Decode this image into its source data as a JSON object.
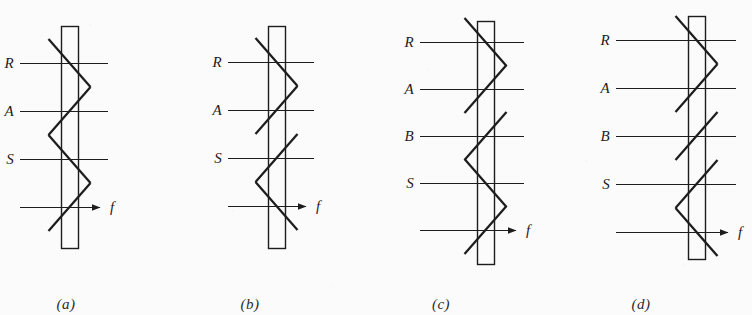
{
  "figure": {
    "type": "diagram",
    "background_color": "#fbfbfb",
    "line_color": "#1d1d1d",
    "panels": [
      {
        "caption": "(a)",
        "caption_x": 66,
        "caption_y": 296,
        "bar": {
          "x": 61,
          "y": 26,
          "width": 17,
          "height": 222
        },
        "levels": [
          {
            "label": "R",
            "y": 63,
            "line_x1": 20,
            "line_x2": 108,
            "slash": "backslash"
          },
          {
            "label": "A",
            "y": 111,
            "line_x1": 20,
            "line_x2": 108,
            "slash": "slash"
          },
          {
            "label": "S",
            "y": 159,
            "line_x1": 20,
            "line_x2": 108,
            "slash": "backslash"
          },
          {
            "label": "f",
            "y": 207,
            "line_x1": 20,
            "line_x2": 100,
            "slash": "slash",
            "arrow": true
          }
        ]
      },
      {
        "caption": "(b)",
        "caption_x": 250,
        "caption_y": 296,
        "bar": {
          "x": 268,
          "y": 26,
          "width": 17,
          "height": 222
        },
        "levels": [
          {
            "label": "R",
            "y": 62,
            "line_x1": 228,
            "line_x2": 314,
            "slash": "backslash"
          },
          {
            "label": "A",
            "y": 110,
            "line_x1": 228,
            "line_x2": 314,
            "slash": "slash"
          },
          {
            "label": "S",
            "y": 158,
            "line_x1": 228,
            "line_x2": 314,
            "slash": "slash"
          },
          {
            "label": "f",
            "y": 206,
            "line_x1": 228,
            "line_x2": 306,
            "slash": "backslash",
            "arrow": true
          }
        ]
      },
      {
        "caption": "(c)",
        "caption_x": 441,
        "caption_y": 296,
        "bar": {
          "x": 477,
          "y": 21,
          "width": 17,
          "height": 243
        },
        "levels": [
          {
            "label": "R",
            "y": 42,
            "line_x1": 420,
            "line_x2": 524,
            "slash": "backslash"
          },
          {
            "label": "A",
            "y": 89,
            "line_x1": 420,
            "line_x2": 524,
            "slash": "slash"
          },
          {
            "label": "B",
            "y": 136,
            "line_x1": 420,
            "line_x2": 524,
            "slash": "slash"
          },
          {
            "label": "S",
            "y": 183,
            "line_x1": 420,
            "line_x2": 524,
            "slash": "backslash"
          },
          {
            "label": "f",
            "y": 230,
            "line_x1": 420,
            "line_x2": 516,
            "slash": "slash",
            "arrow": true
          }
        ]
      },
      {
        "caption": "(d)",
        "caption_x": 641,
        "caption_y": 296,
        "bar": {
          "x": 688,
          "y": 16,
          "width": 17,
          "height": 243
        },
        "levels": [
          {
            "label": "R",
            "y": 40,
            "line_x1": 616,
            "line_x2": 736,
            "slash": "backslash"
          },
          {
            "label": "A",
            "y": 88,
            "line_x1": 616,
            "line_x2": 736,
            "slash": "slash"
          },
          {
            "label": "B",
            "y": 136,
            "line_x1": 616,
            "line_x2": 736,
            "slash": "slash"
          },
          {
            "label": "S",
            "y": 184,
            "line_x1": 616,
            "line_x2": 736,
            "slash": "slash"
          },
          {
            "label": "f",
            "y": 232,
            "line_x1": 616,
            "line_x2": 728,
            "slash": "backslash",
            "arrow": true
          }
        ]
      }
    ]
  }
}
